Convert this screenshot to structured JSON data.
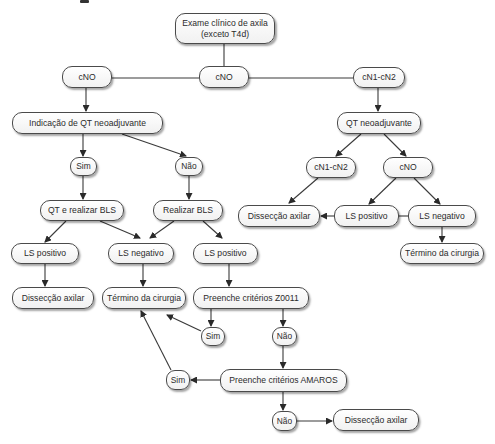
{
  "diagram": {
    "type": "flowchart",
    "heading_fragment": "",
    "nodes": [
      {
        "id": "exame",
        "label": "Exame clínico de axila (exceto T4d)",
        "line1": "Exame clínico de axila",
        "line2": "(exceto T4d)",
        "x": 175,
        "y": 13,
        "w": 100,
        "h": 31
      },
      {
        "id": "cno_left",
        "label": "cNO",
        "x": 62,
        "y": 66,
        "w": 50,
        "h": 22
      },
      {
        "id": "cno_center",
        "label": "cNO",
        "x": 199,
        "y": 66,
        "w": 50,
        "h": 22
      },
      {
        "id": "cn1cn2_top",
        "label": "cN1-cN2",
        "x": 353,
        "y": 67,
        "w": 52,
        "h": 21
      },
      {
        "id": "indicacao",
        "label": "Indicação de QT neoadjuvante",
        "x": 12,
        "y": 112,
        "w": 151,
        "h": 22
      },
      {
        "id": "qt_neo",
        "label": "QT neoadjuvante",
        "x": 337,
        "y": 112,
        "w": 84,
        "h": 22
      },
      {
        "id": "sim1",
        "label": "Sim",
        "x": 70,
        "y": 157,
        "w": 27,
        "h": 19
      },
      {
        "id": "nao1",
        "label": "Não",
        "x": 175,
        "y": 157,
        "w": 28,
        "h": 19
      },
      {
        "id": "cn1cn2_r",
        "label": "cN1-cN2",
        "x": 306,
        "y": 157,
        "w": 50,
        "h": 21
      },
      {
        "id": "cno_r",
        "label": "cNO",
        "x": 383,
        "y": 157,
        "w": 50,
        "h": 21
      },
      {
        "id": "qt_bls",
        "label": "QT e realizar BLS",
        "x": 40,
        "y": 200,
        "w": 84,
        "h": 21
      },
      {
        "id": "realizar_bls",
        "label": "Realizar BLS",
        "x": 153,
        "y": 200,
        "w": 70,
        "h": 21
      },
      {
        "id": "disseccao_r",
        "label": "Dissecção axilar",
        "x": 238,
        "y": 205,
        "w": 82,
        "h": 22
      },
      {
        "id": "lspos_r",
        "label": "LS positivo",
        "x": 334,
        "y": 205,
        "w": 65,
        "h": 22
      },
      {
        "id": "lsneg_r",
        "label": "LS negativo",
        "x": 408,
        "y": 205,
        "w": 68,
        "h": 22
      },
      {
        "id": "lspos_l",
        "label": "LS positivo",
        "x": 11,
        "y": 243,
        "w": 68,
        "h": 21
      },
      {
        "id": "lsneg_m",
        "label": "LS negativo",
        "x": 108,
        "y": 243,
        "w": 66,
        "h": 21
      },
      {
        "id": "lspos_m",
        "label": "LS positivo",
        "x": 193,
        "y": 243,
        "w": 65,
        "h": 21
      },
      {
        "id": "termino_r",
        "label": "Término da cirurgia",
        "x": 400,
        "y": 243,
        "w": 84,
        "h": 21
      },
      {
        "id": "disseccao_l",
        "label": "Dissecção axilar",
        "x": 12,
        "y": 287,
        "w": 82,
        "h": 22
      },
      {
        "id": "termino_m",
        "label": "Término da cirurgia",
        "x": 102,
        "y": 287,
        "w": 84,
        "h": 22
      },
      {
        "id": "z0011",
        "label": "Preenche critérios Z0011",
        "x": 193,
        "y": 287,
        "w": 116,
        "h": 22
      },
      {
        "id": "sim_z",
        "label": "Sim",
        "x": 201,
        "y": 327,
        "w": 24,
        "h": 19
      },
      {
        "id": "nao_z",
        "label": "Não",
        "x": 272,
        "y": 327,
        "w": 25,
        "h": 19
      },
      {
        "id": "sim_a",
        "label": "Sim",
        "x": 166,
        "y": 370,
        "w": 24,
        "h": 20
      },
      {
        "id": "amaros",
        "label": "Preenche critérios AMAROS",
        "x": 220,
        "y": 369,
        "w": 127,
        "h": 23
      },
      {
        "id": "nao_a",
        "label": "Não",
        "x": 272,
        "y": 411,
        "w": 25,
        "h": 20
      },
      {
        "id": "disseccao_b",
        "label": "Dissecção axilar",
        "x": 333,
        "y": 409,
        "w": 86,
        "h": 22
      }
    ],
    "edges": [
      {
        "from": "exame",
        "to": "cno_center",
        "arrow": false
      },
      {
        "from": "cno_center",
        "to": "cno_left",
        "arrow": false
      },
      {
        "from": "cno_center",
        "to": "cn1cn2_top",
        "arrow": false
      },
      {
        "from": "cno_left",
        "to": "indicacao",
        "arrow": true
      },
      {
        "from": "indicacao",
        "to": "sim1",
        "arrow": true
      },
      {
        "from": "indicacao",
        "to": "nao1",
        "arrow": true
      },
      {
        "from": "sim1",
        "to": "qt_bls",
        "arrow": true
      },
      {
        "from": "nao1",
        "to": "realizar_bls",
        "arrow": true
      },
      {
        "from": "qt_bls",
        "to": "lspos_l",
        "arrow": true
      },
      {
        "from": "qt_bls",
        "to": "lsneg_m",
        "arrow": true
      },
      {
        "from": "realizar_bls",
        "to": "lsneg_m",
        "arrow": true
      },
      {
        "from": "realizar_bls",
        "to": "lspos_m",
        "arrow": true
      },
      {
        "from": "lspos_l",
        "to": "disseccao_l",
        "arrow": true
      },
      {
        "from": "lsneg_m",
        "to": "termino_m",
        "arrow": true
      },
      {
        "from": "lspos_m",
        "to": "z0011",
        "arrow": true
      },
      {
        "from": "z0011",
        "to": "sim_z",
        "arrow": true
      },
      {
        "from": "z0011",
        "to": "nao_z",
        "arrow": true
      },
      {
        "from": "sim_z",
        "to": "termino_m",
        "arrow": true
      },
      {
        "from": "nao_z",
        "to": "amaros",
        "arrow": true
      },
      {
        "from": "amaros",
        "to": "sim_a",
        "arrow": true
      },
      {
        "from": "sim_a",
        "to": "termino_m",
        "arrow": true
      },
      {
        "from": "amaros",
        "to": "nao_a",
        "arrow": true
      },
      {
        "from": "nao_a",
        "to": "disseccao_b",
        "arrow": true
      },
      {
        "from": "cn1cn2_top",
        "to": "qt_neo",
        "arrow": true
      },
      {
        "from": "qt_neo",
        "to": "cn1cn2_r",
        "arrow": true
      },
      {
        "from": "qt_neo",
        "to": "cno_r",
        "arrow": true
      },
      {
        "from": "cn1cn2_r",
        "to": "disseccao_r",
        "arrow": true
      },
      {
        "from": "cno_r",
        "to": "lspos_r",
        "arrow": true
      },
      {
        "from": "cno_r",
        "to": "lsneg_r",
        "arrow": true
      },
      {
        "from": "lspos_r",
        "to": "disseccao_r",
        "arrow": true
      },
      {
        "from": "lsneg_r",
        "to": "lspos_r",
        "arrow": false
      },
      {
        "from": "lsneg_r",
        "to": "termino_r",
        "arrow": true
      }
    ],
    "colors": {
      "stroke": "#3a3a3a",
      "node_border": "#4a4a4a",
      "text": "#2b2b2b",
      "background": "#ffffff"
    }
  }
}
